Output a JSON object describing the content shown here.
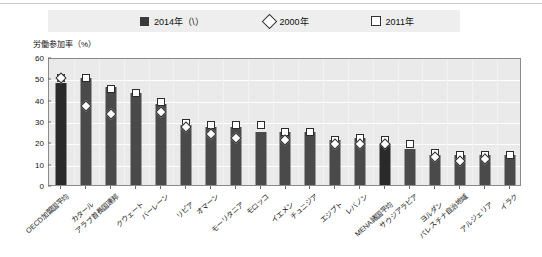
{
  "legend": {
    "items": [
      {
        "label": "2014年（\\）",
        "marker": "filled-square",
        "color": "#2a2a2a"
      },
      {
        "label": "2000年",
        "marker": "open-diamond",
        "color": "#ffffff"
      },
      {
        "label": "2011年",
        "marker": "open-square",
        "color": "#ffffff"
      }
    ]
  },
  "axis": {
    "y_title": "労働参加率（%）",
    "y_ticks": [
      60,
      50,
      40,
      30,
      20,
      10,
      0
    ]
  },
  "chart_data": {
    "type": "bar",
    "title": "",
    "subtitle": "",
    "xlabel": "",
    "ylabel": "労働参加率（%）",
    "ylim": [
      0,
      60
    ],
    "ytick_step": 10,
    "grid": true,
    "legend_position": "top",
    "categories": [
      "OECD加盟国平均",
      "カタール",
      "アラブ首長国連邦",
      "クウェート",
      "バーレーン",
      "リビア",
      "オマーン",
      "モーリタニア",
      "モロッコ",
      "イエメン",
      "チュニジア",
      "エジプト",
      "レバノン",
      "MENA諸国平均",
      "サウジアラビア",
      "ヨルダン",
      "パレスチナ自治地域",
      "アルジェリア",
      "イラク"
    ],
    "series": [
      {
        "name": "2014年（\\）",
        "type": "bar",
        "values": [
          48,
          50,
          46,
          43,
          38,
          28,
          27,
          27,
          25,
          25,
          25,
          21,
          22,
          19,
          17,
          14,
          14,
          14,
          14
        ]
      },
      {
        "name": "2000年",
        "type": "diamond-marker",
        "values": [
          51,
          38,
          34,
          null,
          35,
          28,
          25,
          23,
          null,
          22,
          null,
          20,
          20,
          20,
          null,
          14,
          12,
          13,
          null
        ]
      },
      {
        "name": "2011年",
        "type": "square-marker",
        "values": [
          51,
          51,
          46,
          44,
          40,
          30,
          29,
          29,
          29,
          26,
          26,
          22,
          23,
          22,
          20,
          16,
          15,
          15,
          15
        ]
      }
    ]
  }
}
